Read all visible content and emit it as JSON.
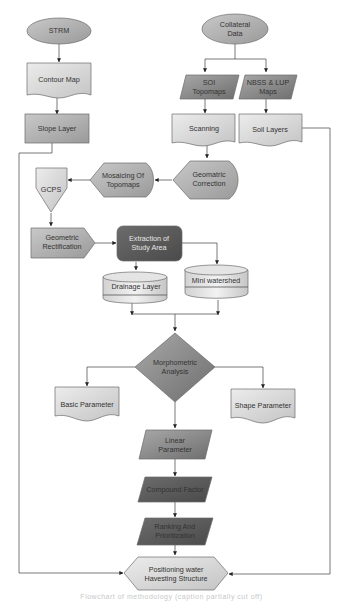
{
  "diagram": {
    "type": "flowchart",
    "nodes": {
      "strm": {
        "label": "STRM",
        "shape": "ellipse"
      },
      "collateral": {
        "label1": "Collateral",
        "label2": "Data",
        "shape": "ellipse"
      },
      "contour": {
        "label": "Contour Map",
        "shape": "document"
      },
      "soi": {
        "label1": "SOI",
        "label2": "Topomaps",
        "shape": "parallelogram"
      },
      "nbss": {
        "label1": "NBSS & LUP",
        "label2": "Maps",
        "shape": "parallelogram"
      },
      "slope": {
        "label": "Slope Layer",
        "shape": "rectangle"
      },
      "scanning": {
        "label": "Scanning",
        "shape": "document"
      },
      "soil": {
        "label": "Soil Layers",
        "shape": "document"
      },
      "geocorr": {
        "label1": "Geomatric",
        "label2": "Correction",
        "shape": "display"
      },
      "mosaic": {
        "label1": "Mosaicing Of",
        "label2": "Topomaps",
        "shape": "display"
      },
      "gcps": {
        "label": "GCPS",
        "shape": "offpage-connector"
      },
      "georect": {
        "label1": "Geometric",
        "label2": "Rectification",
        "shape": "pentagon-arrow"
      },
      "extract": {
        "label1": "Extraction of",
        "label2": "Study Area",
        "shape": "rounded-rectangle"
      },
      "drainage": {
        "label": "Drainage Layer",
        "shape": "cylinder"
      },
      "mini": {
        "label": "Mini watershed",
        "shape": "cylinder"
      },
      "morpho": {
        "label1": "Morphometric",
        "label2": "Analysis",
        "shape": "diamond"
      },
      "basic": {
        "label": "Basic Parameter",
        "shape": "document"
      },
      "shape": {
        "label": "Shape Parameter",
        "shape": "document"
      },
      "linear": {
        "label1": "Linear",
        "label2": "Parameter",
        "shape": "parallelogram"
      },
      "compound": {
        "label": "Compound Factor",
        "shape": "parallelogram"
      },
      "ranking": {
        "label1": "Ranking And",
        "label2": "Prioritization",
        "shape": "parallelogram"
      },
      "positioning": {
        "label1": "Positioning water",
        "label2": "Havesting Structure",
        "shape": "hexagon"
      }
    },
    "edges": [
      [
        "STRM",
        "Contour Map"
      ],
      [
        "Contour Map",
        "Slope Layer"
      ],
      [
        "Collateral Data",
        "SOI Topomaps"
      ],
      [
        "Collateral Data",
        "NBSS & LUP Maps"
      ],
      [
        "SOI Topomaps",
        "Scanning"
      ],
      [
        "NBSS & LUP Maps",
        "Soil Layers"
      ],
      [
        "Scanning",
        "Geomatric Correction"
      ],
      [
        "Geomatric Correction",
        "Mosaicing Of Topomaps"
      ],
      [
        "Mosaicing Of Topomaps",
        "GCPS"
      ],
      [
        "GCPS",
        "Geometric Rectification"
      ],
      [
        "Geometric Rectification",
        "Extraction of Study Area"
      ],
      [
        "Extraction of Study Area",
        "Drainage Layer"
      ],
      [
        "Extraction of Study Area",
        "Mini watershed"
      ],
      [
        "Drainage Layer",
        "Morphometric Analysis"
      ],
      [
        "Mini watershed",
        "Morphometric Analysis"
      ],
      [
        "Morphometric Analysis",
        "Basic Parameter"
      ],
      [
        "Morphometric Analysis",
        "Shape Parameter"
      ],
      [
        "Morphometric Analysis",
        "Linear Parameter"
      ],
      [
        "Linear Parameter",
        "Compound Factor"
      ],
      [
        "Compound Factor",
        "Ranking And Prioritization"
      ],
      [
        "Ranking And Prioritization",
        "Positioning water Havesting Structure"
      ],
      [
        "Slope Layer",
        "Positioning water Havesting Structure"
      ],
      [
        "Soil Layers",
        "Positioning water Havesting Structure"
      ]
    ],
    "colors": {
      "light_fill": "#dcdcdc",
      "mid_fill": "#b4b4b4",
      "dark_fill": "#8a8a8a",
      "darkest_fill": "#5c5c5c",
      "edge": "#555555"
    }
  },
  "caption": {
    "text": "Flowchart of methodology (caption partially cut off)"
  }
}
